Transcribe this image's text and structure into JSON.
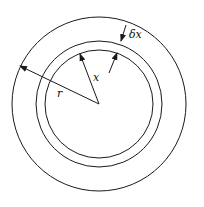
{
  "diagram": {
    "labels": {
      "outer_radius": "r",
      "shell_radius": "x",
      "shell_thickness": "δx"
    },
    "line_color": "#1a1a1a"
  }
}
